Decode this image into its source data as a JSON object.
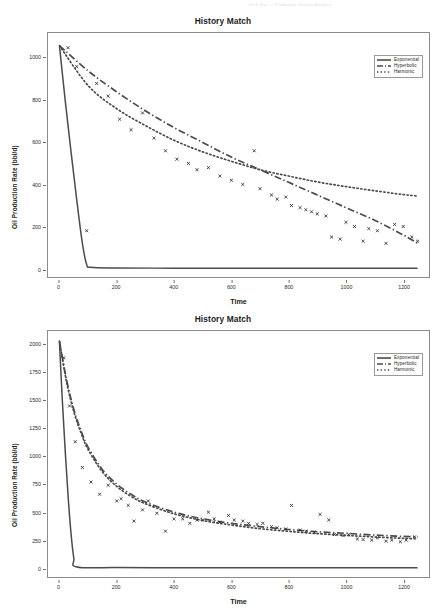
{
  "page_header": {
    "visible_faint_text": "Oil & Gas  —  Production Decline Analysis"
  },
  "colors": {
    "curve": "#4b4b4b",
    "marker": "#2b2b2b",
    "frame": "#8b8b8b",
    "text": "#1c1c1c"
  },
  "figures": [
    {
      "title": "History Match",
      "legend": [
        {
          "label": "Exponential",
          "style": "solid"
        },
        {
          "label": "Hyperbolic",
          "style": "dash-dot"
        },
        {
          "label": "Harmonic",
          "style": "dotted"
        }
      ],
      "chart_data": {
        "type": "scatter",
        "title": "History Match",
        "xlabel": "Time",
        "ylabel": "Oil Production Rate (bbl/d)",
        "xlim": [
          -40,
          1290
        ],
        "ylim": [
          -40,
          1120
        ],
        "xticks": [
          0,
          200,
          400,
          600,
          800,
          1000,
          1200
        ],
        "yticks": [
          0,
          200,
          400,
          600,
          800,
          1000
        ],
        "grid": false,
        "legend_position": "top-right",
        "series": [
          {
            "name": "Exponential",
            "style": "solid",
            "x": [
              0,
              20,
              40,
              60,
              80,
              95,
              110,
              200,
              400,
              600,
              800,
              1000,
              1200,
              1250
            ],
            "y": [
              1060,
              800,
              560,
              330,
              120,
              20,
              6,
              3,
              2,
              2,
              2,
              2,
              2,
              2
            ]
          },
          {
            "name": "Hyperbolic",
            "style": "dash-dot",
            "x": [
              0,
              100,
              200,
              300,
              400,
              500,
              600,
              700,
              800,
              900,
              1000,
              1100,
              1200,
              1250
            ],
            "y": [
              1060,
              940,
              840,
              750,
              670,
              600,
              530,
              470,
              410,
              350,
              290,
              230,
              160,
              120
            ]
          },
          {
            "name": "Harmonic",
            "style": "dotted",
            "x": [
              0,
              100,
              200,
              300,
              400,
              500,
              600,
              700,
              800,
              900,
              1000,
              1100,
              1200,
              1250
            ],
            "y": [
              1060,
              870,
              760,
              680,
              610,
              555,
              510,
              470,
              440,
              412,
              390,
              370,
              352,
              345
            ]
          },
          {
            "name": "Observed data",
            "style": "x-markers",
            "x": [
              30,
              60,
              95,
              130,
              170,
              210,
              250,
              290,
              330,
              370,
              410,
              450,
              480,
              520,
              560,
              600,
              640,
              680,
              700,
              740,
              760,
              790,
              810,
              840,
              860,
              880,
              900,
              930,
              950,
              980,
              1000,
              1030,
              1060,
              1080,
              1110,
              1140,
              1170,
              1200,
              1230,
              1250
            ],
            "y": [
              1050,
              960,
              180,
              880,
              820,
              710,
              660,
              740,
              620,
              560,
              520,
              500,
              470,
              480,
              440,
              420,
              400,
              560,
              380,
              350,
              330,
              340,
              300,
              290,
              280,
              270,
              260,
              250,
              150,
              140,
              220,
              200,
              130,
              190,
              180,
              120,
              210,
              200,
              150,
              130
            ]
          }
        ]
      }
    },
    {
      "title": "History Match",
      "legend": [
        {
          "label": "Exponential",
          "style": "solid"
        },
        {
          "label": "Hyperbolic",
          "style": "dash-dot"
        },
        {
          "label": "Harmonic",
          "style": "dotted"
        }
      ],
      "chart_data": {
        "type": "scatter",
        "title": "History Match",
        "xlabel": "Time",
        "ylabel": "Oil Production Rate (bbl/d)",
        "xlim": [
          -40,
          1290
        ],
        "ylim": [
          -80,
          2120
        ],
        "xticks": [
          0,
          200,
          400,
          600,
          800,
          1000,
          1200
        ],
        "yticks": [
          0,
          250,
          500,
          750,
          1000,
          1250,
          1500,
          1750,
          2000
        ],
        "grid": false,
        "legend_position": "top-right",
        "series": [
          {
            "name": "Exponential",
            "style": "solid",
            "x": [
              0,
              10,
              20,
              30,
              40,
              50,
              60,
              200,
              400,
              600,
              800,
              1000,
              1200,
              1250
            ],
            "y": [
              2020,
              1500,
              1050,
              650,
              320,
              90,
              10,
              4,
              3,
              3,
              3,
              3,
              3,
              3
            ]
          },
          {
            "name": "Hyperbolic",
            "style": "dash-dot",
            "x": [
              0,
              25,
              50,
              75,
              100,
              150,
              200,
              250,
              300,
              400,
              500,
              600,
              700,
              800,
              900,
              1000,
              1100,
              1200,
              1250
            ],
            "y": [
              2030,
              1680,
              1420,
              1230,
              1080,
              880,
              750,
              660,
              590,
              500,
              440,
              400,
              370,
              345,
              325,
              310,
              295,
              283,
              278
            ]
          },
          {
            "name": "Harmonic",
            "style": "dotted",
            "x": [
              0,
              25,
              50,
              75,
              100,
              150,
              200,
              250,
              300,
              400,
              500,
              600,
              700,
              800,
              900,
              1000,
              1100,
              1200,
              1250
            ],
            "y": [
              2030,
              1660,
              1400,
              1210,
              1060,
              860,
              730,
              640,
              575,
              485,
              425,
              385,
              352,
              328,
              308,
              292,
              278,
              266,
              261
            ]
          },
          {
            "name": "Observed data",
            "style": "x-markers",
            "x": [
              15,
              35,
              55,
              80,
              110,
              140,
              170,
              200,
              215,
              240,
              260,
              290,
              310,
              340,
              370,
              400,
              430,
              455,
              480,
              500,
              520,
              540,
              560,
              590,
              610,
              640,
              660,
              690,
              710,
              740,
              760,
              790,
              810,
              840,
              860,
              890,
              910,
              940,
              960,
              990,
              1010,
              1040,
              1060,
              1090,
              1110,
              1140,
              1160,
              1190,
              1210,
              1240
            ],
            "y": [
              1880,
              1450,
              1130,
              900,
              770,
              660,
              740,
              600,
              620,
              560,
              420,
              520,
              600,
              490,
              330,
              440,
              440,
              400,
              430,
              430,
              500,
              440,
              410,
              470,
              430,
              420,
              400,
              390,
              400,
              370,
              360,
              350,
              560,
              340,
              330,
              320,
              480,
              430,
              300,
              290,
              300,
              260,
              255,
              250,
              270,
              240,
              250,
              235,
              250,
              280
            ]
          }
        ]
      }
    }
  ]
}
